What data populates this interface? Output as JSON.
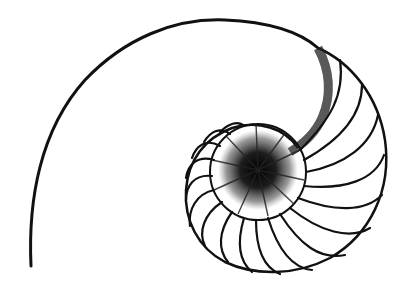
{
  "image": {
    "subject": "nautilus shell cross-section illustration",
    "colors": {
      "background": "#ffffff",
      "ink": "#111111"
    }
  }
}
